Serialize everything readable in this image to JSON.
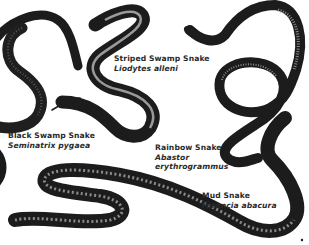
{
  "figure": {
    "kind": "illustrated plate of snakes",
    "colors": {
      "background": "#ffffff",
      "ink": "#1c1c1c",
      "belly_light": "#8a8a8a",
      "stripe": "#9a9a9a",
      "text": "#2a2a2a"
    }
  },
  "labels": [
    {
      "common": "Striped Swamp Snake",
      "scientific": "Liodytes alleni"
    },
    {
      "common": "Black Swamp Snake",
      "scientific": "Seminatrix pygaea"
    },
    {
      "common": "Rainbow Snake",
      "scientific": "Abastor",
      "scientific_line2": "erythrogrammus"
    },
    {
      "common": "Mud Snake",
      "scientific": "Farancia abacura"
    }
  ]
}
